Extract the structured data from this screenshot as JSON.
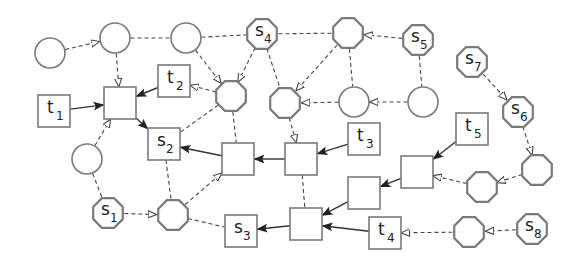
{
  "diagram": {
    "nodes": [
      {
        "id": "c1",
        "shape": "circle",
        "label": "",
        "sub": ""
      },
      {
        "id": "c2",
        "shape": "circle",
        "label": "",
        "sub": ""
      },
      {
        "id": "c3",
        "shape": "circle",
        "label": "",
        "sub": ""
      },
      {
        "id": "s4",
        "shape": "octagon",
        "label": "s",
        "sub": "4"
      },
      {
        "id": "o1",
        "shape": "octagon",
        "label": "",
        "sub": ""
      },
      {
        "id": "s5",
        "shape": "octagon",
        "label": "s",
        "sub": "5"
      },
      {
        "id": "s7",
        "shape": "octagon",
        "label": "s",
        "sub": "7"
      },
      {
        "id": "s6",
        "shape": "octagon",
        "label": "s",
        "sub": "6"
      },
      {
        "id": "t1",
        "shape": "square",
        "label": "t",
        "sub": "1"
      },
      {
        "id": "b0",
        "shape": "square",
        "label": "",
        "sub": ""
      },
      {
        "id": "t2",
        "shape": "square",
        "label": "t",
        "sub": "2"
      },
      {
        "id": "o2",
        "shape": "octagon",
        "label": "",
        "sub": ""
      },
      {
        "id": "o3",
        "shape": "octagon",
        "label": "",
        "sub": ""
      },
      {
        "id": "c4",
        "shape": "circle",
        "label": "",
        "sub": ""
      },
      {
        "id": "c5",
        "shape": "circle",
        "label": "",
        "sub": ""
      },
      {
        "id": "c6",
        "shape": "circle",
        "label": "",
        "sub": ""
      },
      {
        "id": "s2",
        "shape": "square",
        "label": "s",
        "sub": "2"
      },
      {
        "id": "b1",
        "shape": "square",
        "label": "",
        "sub": ""
      },
      {
        "id": "b2",
        "shape": "square",
        "label": "",
        "sub": ""
      },
      {
        "id": "t3",
        "shape": "square",
        "label": "t",
        "sub": "3"
      },
      {
        "id": "t5",
        "shape": "square",
        "label": "t",
        "sub": "5"
      },
      {
        "id": "b4",
        "shape": "square",
        "label": "",
        "sub": ""
      },
      {
        "id": "o6",
        "shape": "octagon",
        "label": "",
        "sub": ""
      },
      {
        "id": "o5",
        "shape": "octagon",
        "label": "",
        "sub": ""
      },
      {
        "id": "b5",
        "shape": "square",
        "label": "",
        "sub": ""
      },
      {
        "id": "s1",
        "shape": "octagon",
        "label": "s",
        "sub": "1"
      },
      {
        "id": "o4",
        "shape": "octagon",
        "label": "",
        "sub": ""
      },
      {
        "id": "s3",
        "shape": "square",
        "label": "s",
        "sub": "3"
      },
      {
        "id": "b3",
        "shape": "square",
        "label": "",
        "sub": ""
      },
      {
        "id": "t4",
        "shape": "square",
        "label": "t",
        "sub": "4"
      },
      {
        "id": "o7",
        "shape": "octagon",
        "label": "",
        "sub": ""
      },
      {
        "id": "s8",
        "shape": "octagon",
        "label": "s",
        "sub": "8"
      }
    ],
    "edges": [
      {
        "from": "c1",
        "to": "c2",
        "style": "dashed",
        "arrow": "open"
      },
      {
        "from": "c2",
        "to": "c3",
        "style": "dashed",
        "arrow": "none"
      },
      {
        "from": "c3",
        "to": "s4",
        "style": "dashed",
        "arrow": "none"
      },
      {
        "from": "s4",
        "to": "o1",
        "style": "dashed",
        "arrow": "none"
      },
      {
        "from": "s5",
        "to": "o1",
        "style": "dashed",
        "arrow": "open"
      },
      {
        "from": "c2",
        "to": "b0",
        "style": "dashed",
        "arrow": "open"
      },
      {
        "from": "t1",
        "to": "b0",
        "style": "solid",
        "arrow": "filled"
      },
      {
        "from": "t2",
        "to": "b0",
        "style": "solid",
        "arrow": "filled"
      },
      {
        "from": "o2",
        "to": "t2",
        "style": "dashed",
        "arrow": "open"
      },
      {
        "from": "c3",
        "to": "o2",
        "style": "dashed",
        "arrow": "open"
      },
      {
        "from": "s4",
        "to": "o2",
        "style": "dashed",
        "arrow": "open"
      },
      {
        "from": "s4",
        "to": "o3",
        "style": "dashed",
        "arrow": "none"
      },
      {
        "from": "o1",
        "to": "o3",
        "style": "dashed",
        "arrow": "open"
      },
      {
        "from": "c4",
        "to": "o3",
        "style": "dashed",
        "arrow": "open"
      },
      {
        "from": "c5",
        "to": "c4",
        "style": "dashed",
        "arrow": "open"
      },
      {
        "from": "o1",
        "to": "c4",
        "style": "dashed",
        "arrow": "none"
      },
      {
        "from": "s5",
        "to": "c5",
        "style": "dashed",
        "arrow": "none"
      },
      {
        "from": "b0",
        "to": "s2",
        "style": "solid",
        "arrow": "filled"
      },
      {
        "from": "c6",
        "to": "b0",
        "style": "dashed",
        "arrow": "open"
      },
      {
        "from": "o2",
        "to": "s2",
        "style": "dashed",
        "arrow": "none"
      },
      {
        "from": "o2",
        "to": "b1",
        "style": "dashed",
        "arrow": "none"
      },
      {
        "from": "o3",
        "to": "b2",
        "style": "dashed",
        "arrow": "open"
      },
      {
        "from": "b1",
        "to": "s2",
        "style": "solid",
        "arrow": "filled"
      },
      {
        "from": "b2",
        "to": "b1",
        "style": "solid",
        "arrow": "filled"
      },
      {
        "from": "t3",
        "to": "b2",
        "style": "solid",
        "arrow": "filled"
      },
      {
        "from": "b2",
        "to": "b3",
        "style": "dashed",
        "arrow": "none"
      },
      {
        "from": "c6",
        "to": "s1",
        "style": "dashed",
        "arrow": "none"
      },
      {
        "from": "s1",
        "to": "o4",
        "style": "dashed",
        "arrow": "open"
      },
      {
        "from": "s2",
        "to": "o4",
        "style": "dashed",
        "arrow": "none"
      },
      {
        "from": "o4",
        "to": "b1",
        "style": "dashed",
        "arrow": "open"
      },
      {
        "from": "o4",
        "to": "s3",
        "style": "dashed",
        "arrow": "none"
      },
      {
        "from": "b3",
        "to": "s3",
        "style": "solid",
        "arrow": "filled"
      },
      {
        "from": "b5",
        "to": "b3",
        "style": "solid",
        "arrow": "filled"
      },
      {
        "from": "t4",
        "to": "b3",
        "style": "solid",
        "arrow": "filled"
      },
      {
        "from": "b4",
        "to": "b5",
        "style": "solid",
        "arrow": "filled"
      },
      {
        "from": "t5",
        "to": "b4",
        "style": "solid",
        "arrow": "filled"
      },
      {
        "from": "o5",
        "to": "b4",
        "style": "dashed",
        "arrow": "open"
      },
      {
        "from": "o6",
        "to": "o5",
        "style": "dashed",
        "arrow": "open"
      },
      {
        "from": "s6",
        "to": "o6",
        "style": "dashed",
        "arrow": "open"
      },
      {
        "from": "s7",
        "to": "s6",
        "style": "dashed",
        "arrow": "open"
      },
      {
        "from": "s8",
        "to": "o7",
        "style": "dashed",
        "arrow": "open"
      },
      {
        "from": "o7",
        "to": "t4",
        "style": "dashed",
        "arrow": "open"
      }
    ]
  }
}
